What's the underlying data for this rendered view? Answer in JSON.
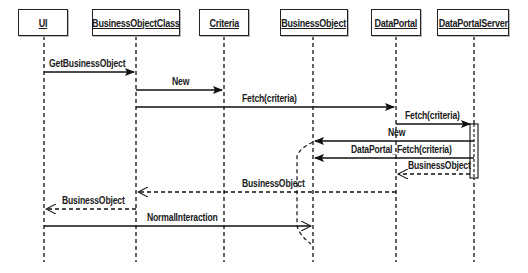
{
  "diagram": {
    "type": "UML sequence diagram",
    "objects": [
      {
        "id": "ui",
        "label": "UI",
        "box_left": 18,
        "box_width": 50,
        "lifeline_x": 44
      },
      {
        "id": "bo_class",
        "label": "BusinessObjectClass",
        "box_left": 92,
        "box_width": 88,
        "lifeline_x": 136
      },
      {
        "id": "criteria",
        "label": "Criteria",
        "box_left": 199,
        "box_width": 50,
        "lifeline_x": 224
      },
      {
        "id": "bo",
        "label": "BusinessObject",
        "box_left": 280,
        "box_width": 68,
        "lifeline_x": 313
      },
      {
        "id": "dataportal",
        "label": "DataPortal",
        "box_left": 371,
        "box_width": 50,
        "lifeline_x": 396
      },
      {
        "id": "dps",
        "label": "DataPortalServer",
        "box_left": 437,
        "box_width": 72,
        "lifeline_x": 474
      }
    ],
    "messages": [
      {
        "label": "GetBusinessObject",
        "from": "ui",
        "to": "bo_class",
        "y": 72,
        "style": "solid",
        "arrow": "filled"
      },
      {
        "label": "New",
        "from": "bo_class",
        "to": "criteria",
        "y": 90,
        "style": "solid",
        "arrow": "filled"
      },
      {
        "label": "Fetch(criteria)",
        "from": "bo_class",
        "to": "dataportal",
        "y": 107,
        "style": "solid",
        "arrow": "filled"
      },
      {
        "label": "Fetch(criteria)",
        "from": "dataportal",
        "to": "dps",
        "y": 124,
        "style": "solid",
        "arrow": "filled"
      },
      {
        "label": "New",
        "from": "dps",
        "to": "bo",
        "y": 141,
        "style": "solid",
        "arrow": "filled"
      },
      {
        "label": "DataPortal_Fetch(criteria)",
        "from": "dps",
        "to": "bo",
        "y": 158,
        "style": "solid",
        "arrow": "filled"
      },
      {
        "label": "BusinessObject",
        "from": "dps",
        "to": "dataportal",
        "y": 174,
        "style": "dashed",
        "arrow": "open"
      },
      {
        "label": "BusinessObject",
        "from": "dataportal",
        "to": "bo_class",
        "y": 192,
        "style": "dashed",
        "arrow": "open"
      },
      {
        "label": "BusinessObject",
        "from": "bo_class",
        "to": "ui",
        "y": 209,
        "style": "dashed",
        "arrow": "open"
      },
      {
        "label": "NormalInteraction",
        "from": "ui",
        "to": "bo",
        "y": 226,
        "style": "solid",
        "arrow": "open"
      }
    ]
  }
}
